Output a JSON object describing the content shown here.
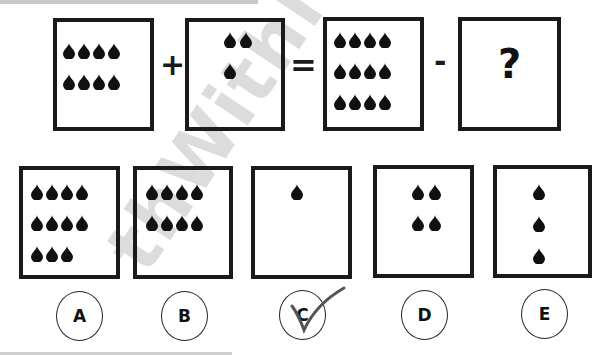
{
  "puzzle": {
    "equation": {
      "boxes": [
        {
          "id": "term1",
          "drops": 8,
          "rows": [
            4,
            4
          ]
        },
        {
          "id": "term2",
          "drops": 3,
          "rows": [
            2,
            1
          ]
        },
        {
          "id": "result",
          "drops": 12,
          "rows": [
            4,
            4,
            4
          ]
        },
        {
          "id": "unknown",
          "label": "?"
        }
      ],
      "operators": {
        "plus": "+",
        "equals": "=",
        "minus": "-"
      }
    },
    "options": [
      {
        "letter": "A",
        "drops": 11,
        "rows": [
          4,
          4,
          3
        ]
      },
      {
        "letter": "B",
        "drops": 8,
        "rows": [
          4,
          4
        ]
      },
      {
        "letter": "C",
        "drops": 1,
        "rows": [
          1
        ],
        "checked": true
      },
      {
        "letter": "D",
        "drops": 4,
        "rows": [
          2,
          2
        ]
      },
      {
        "letter": "E",
        "drops": 3,
        "rows": [
          1,
          1,
          1
        ]
      }
    ],
    "watermark": "thWithMi",
    "colors": {
      "ink": "#1a1a1a",
      "watermark": "#dcdcdc",
      "check": "#555555"
    }
  }
}
